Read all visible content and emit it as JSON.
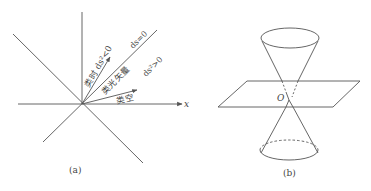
{
  "figure_a": {
    "caption": "(a)",
    "axis_x_label": "x",
    "timelike_label": "类时 ds²<0",
    "lightlike_label": "类光矢量",
    "spacelike_label": "类空",
    "null_label": "ds=0",
    "spacelike_region_label": "ds²>0"
  },
  "figure_b": {
    "caption": "(b)",
    "origin_label": "O"
  },
  "colors": {
    "line": "#555555",
    "text": "#444444",
    "background": "#ffffff"
  }
}
